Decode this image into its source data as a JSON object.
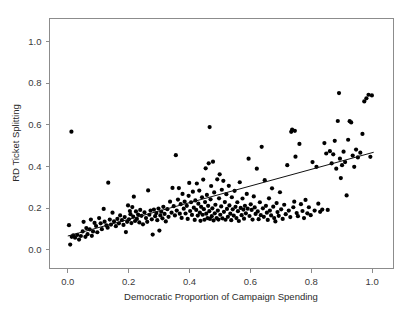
{
  "chart_data": {
    "type": "scatter",
    "title": "",
    "subtitle": "",
    "xlabel": "Democratic Proportion of Campaign Spending",
    "ylabel": "RD Ticket Splitting",
    "xlim": [
      -0.06,
      1.07
    ],
    "ylim": [
      -0.09,
      1.11
    ],
    "xticks": [
      0.0,
      0.2,
      0.4,
      0.6,
      0.8,
      1.0
    ],
    "xticklabels": [
      "0.0",
      "0.2",
      "0.4",
      "0.6",
      "0.8",
      "1.0"
    ],
    "yticks": [
      0.0,
      0.2,
      0.4,
      0.6,
      0.8,
      1.0
    ],
    "yticklabels": [
      "0.0",
      "0.2",
      "0.4",
      "0.6",
      "0.8",
      "1.0"
    ],
    "grid": false,
    "legend": null,
    "marker": "filled-circle",
    "marker_color": "#000000",
    "marker_size": 3.1,
    "frame_color": "#8c8c8c",
    "background": "#ffffff",
    "annotations": [],
    "fit_line": {
      "name": "least-squares fit",
      "color": "#111111",
      "x": [
        0.0,
        1.005
      ],
      "y": [
        0.066,
        0.468
      ],
      "slope": 0.4,
      "intercept": 0.066
    },
    "series": [
      {
        "name": "districts",
        "n_points": 253,
        "points": [
          [
            0.012,
            0.567
          ],
          [
            0.004,
            0.118
          ],
          [
            0.008,
            0.025
          ],
          [
            0.013,
            0.062
          ],
          [
            0.018,
            0.069
          ],
          [
            0.024,
            0.058
          ],
          [
            0.031,
            0.071
          ],
          [
            0.037,
            0.049
          ],
          [
            0.043,
            0.066
          ],
          [
            0.049,
            0.088
          ],
          [
            0.052,
            0.134
          ],
          [
            0.058,
            0.062
          ],
          [
            0.061,
            0.104
          ],
          [
            0.065,
            0.075
          ],
          [
            0.072,
            0.098
          ],
          [
            0.076,
            0.145
          ],
          [
            0.079,
            0.067
          ],
          [
            0.083,
            0.088
          ],
          [
            0.088,
            0.129
          ],
          [
            0.093,
            0.114
          ],
          [
            0.097,
            0.084
          ],
          [
            0.103,
            0.152
          ],
          [
            0.108,
            0.127
          ],
          [
            0.112,
            0.099
          ],
          [
            0.118,
            0.196
          ],
          [
            0.121,
            0.135
          ],
          [
            0.127,
            0.117
          ],
          [
            0.131,
            0.106
          ],
          [
            0.133,
            0.322
          ],
          [
            0.138,
            0.145
          ],
          [
            0.142,
            0.121
          ],
          [
            0.147,
            0.178
          ],
          [
            0.152,
            0.136
          ],
          [
            0.158,
            0.113
          ],
          [
            0.163,
            0.148
          ],
          [
            0.168,
            0.127
          ],
          [
            0.172,
            0.165
          ],
          [
            0.178,
            0.142
          ],
          [
            0.183,
            0.119
          ],
          [
            0.187,
            0.157
          ],
          [
            0.191,
            0.085
          ],
          [
            0.195,
            0.134
          ],
          [
            0.198,
            0.213
          ],
          [
            0.201,
            0.146
          ],
          [
            0.204,
            0.186
          ],
          [
            0.206,
            0.171
          ],
          [
            0.209,
            0.128
          ],
          [
            0.212,
            0.205
          ],
          [
            0.215,
            0.159
          ],
          [
            0.217,
            0.255
          ],
          [
            0.221,
            0.138
          ],
          [
            0.224,
            0.184
          ],
          [
            0.227,
            0.148
          ],
          [
            0.231,
            0.169
          ],
          [
            0.235,
            0.131
          ],
          [
            0.238,
            0.191
          ],
          [
            0.242,
            0.163
          ],
          [
            0.247,
            0.122
          ],
          [
            0.252,
            0.179
          ],
          [
            0.257,
            0.152
          ],
          [
            0.261,
            0.134
          ],
          [
            0.264,
            0.285
          ],
          [
            0.268,
            0.168
          ],
          [
            0.272,
            0.188
          ],
          [
            0.276,
            0.146
          ],
          [
            0.279,
            0.073
          ],
          [
            0.283,
            0.193
          ],
          [
            0.287,
            0.161
          ],
          [
            0.291,
            0.176
          ],
          [
            0.294,
            0.142
          ],
          [
            0.298,
            0.198
          ],
          [
            0.301,
            0.092
          ],
          [
            0.304,
            0.165
          ],
          [
            0.307,
            0.183
          ],
          [
            0.311,
            0.151
          ],
          [
            0.314,
            0.206
          ],
          [
            0.318,
            0.172
          ],
          [
            0.322,
            0.136
          ],
          [
            0.327,
            0.195
          ],
          [
            0.331,
            0.158
          ],
          [
            0.336,
            0.231
          ],
          [
            0.341,
            0.178
          ],
          [
            0.344,
            0.297
          ],
          [
            0.348,
            0.209
          ],
          [
            0.352,
            0.165
          ],
          [
            0.355,
            0.454
          ],
          [
            0.358,
            0.188
          ],
          [
            0.362,
            0.241
          ],
          [
            0.365,
            0.296
          ],
          [
            0.368,
            0.173
          ],
          [
            0.371,
            0.219
          ],
          [
            0.374,
            0.153
          ],
          [
            0.377,
            0.268
          ],
          [
            0.381,
            0.197
          ],
          [
            0.384,
            0.231
          ],
          [
            0.387,
            0.174
          ],
          [
            0.391,
            0.211
          ],
          [
            0.394,
            0.148
          ],
          [
            0.397,
            0.259
          ],
          [
            0.399,
            0.321
          ],
          [
            0.402,
            0.186
          ],
          [
            0.405,
            0.228
          ],
          [
            0.408,
            0.167
          ],
          [
            0.411,
            0.279
          ],
          [
            0.414,
            0.202
          ],
          [
            0.417,
            0.143
          ],
          [
            0.419,
            0.237
          ],
          [
            0.422,
            0.191
          ],
          [
            0.424,
            0.318
          ],
          [
            0.427,
            0.164
          ],
          [
            0.429,
            0.221
          ],
          [
            0.432,
            0.284
          ],
          [
            0.434,
            0.178
          ],
          [
            0.436,
            0.139
          ],
          [
            0.438,
            0.206
          ],
          [
            0.441,
            0.252
          ],
          [
            0.443,
            0.168
          ],
          [
            0.445,
            0.337
          ],
          [
            0.447,
            0.195
          ],
          [
            0.449,
            0.144
          ],
          [
            0.451,
            0.229
          ],
          [
            0.453,
            0.391
          ],
          [
            0.455,
            0.173
          ],
          [
            0.457,
            0.263
          ],
          [
            0.459,
            0.152
          ],
          [
            0.461,
            0.211
          ],
          [
            0.463,
            0.415
          ],
          [
            0.465,
            0.185
          ],
          [
            0.467,
            0.148
          ],
          [
            0.469,
            0.242
          ],
          [
            0.471,
            0.306
          ],
          [
            0.473,
            0.161
          ],
          [
            0.475,
            0.199
          ],
          [
            0.477,
            0.423
          ],
          [
            0.479,
            0.141
          ],
          [
            0.481,
            0.275
          ],
          [
            0.483,
            0.175
          ],
          [
            0.485,
            0.216
          ],
          [
            0.466,
            0.589
          ],
          [
            0.489,
            0.152
          ],
          [
            0.491,
            0.338
          ],
          [
            0.493,
            0.188
          ],
          [
            0.495,
            0.145
          ],
          [
            0.497,
            0.247
          ],
          [
            0.499,
            0.362
          ],
          [
            0.501,
            0.168
          ],
          [
            0.504,
            0.208
          ],
          [
            0.506,
            0.288
          ],
          [
            0.508,
            0.151
          ],
          [
            0.511,
            0.331
          ],
          [
            0.513,
            0.182
          ],
          [
            0.516,
            0.229
          ],
          [
            0.518,
            0.144
          ],
          [
            0.521,
            0.267
          ],
          [
            0.523,
            0.196
          ],
          [
            0.526,
            0.158
          ],
          [
            0.529,
            0.307
          ],
          [
            0.531,
            0.213
          ],
          [
            0.534,
            0.173
          ],
          [
            0.537,
            0.142
          ],
          [
            0.539,
            0.252
          ],
          [
            0.542,
            0.194
          ],
          [
            0.545,
            0.164
          ],
          [
            0.548,
            0.283
          ],
          [
            0.551,
            0.206
          ],
          [
            0.554,
            0.152
          ],
          [
            0.557,
            0.228
          ],
          [
            0.559,
            0.185
          ],
          [
            0.562,
            0.138
          ],
          [
            0.565,
            0.324
          ],
          [
            0.568,
            0.201
          ],
          [
            0.571,
            0.166
          ],
          [
            0.574,
            0.246
          ],
          [
            0.577,
            0.193
          ],
          [
            0.579,
            0.149
          ],
          [
            0.582,
            0.211
          ],
          [
            0.585,
            0.175
          ],
          [
            0.588,
            0.268
          ],
          [
            0.591,
            0.197
          ],
          [
            0.594,
            0.437
          ],
          [
            0.597,
            0.162
          ],
          [
            0.601,
            0.218
          ],
          [
            0.604,
            0.191
          ],
          [
            0.607,
            0.145
          ],
          [
            0.611,
            0.256
          ],
          [
            0.614,
            0.203
          ],
          [
            0.617,
            0.172
          ],
          [
            0.621,
            0.389
          ],
          [
            0.624,
            0.184
          ],
          [
            0.627,
            0.147
          ],
          [
            0.631,
            0.228
          ],
          [
            0.634,
            0.166
          ],
          [
            0.637,
            0.494
          ],
          [
            0.641,
            0.199
          ],
          [
            0.644,
            0.158
          ],
          [
            0.647,
            0.334
          ],
          [
            0.651,
            0.211
          ],
          [
            0.654,
            0.178
          ],
          [
            0.657,
            0.143
          ],
          [
            0.661,
            0.247
          ],
          [
            0.664,
            0.188
          ],
          [
            0.668,
            0.165
          ],
          [
            0.671,
            0.295
          ],
          [
            0.675,
            0.207
          ],
          [
            0.678,
            0.152
          ],
          [
            0.682,
            0.136
          ],
          [
            0.686,
            0.224
          ],
          [
            0.689,
            0.181
          ],
          [
            0.693,
            0.163
          ],
          [
            0.697,
            0.276
          ],
          [
            0.701,
            0.194
          ],
          [
            0.706,
            0.148
          ],
          [
            0.711,
            0.216
          ],
          [
            0.716,
            0.171
          ],
          [
            0.721,
            0.406
          ],
          [
            0.726,
            0.188
          ],
          [
            0.731,
            0.157
          ],
          [
            0.734,
            0.566
          ],
          [
            0.737,
            0.577
          ],
          [
            0.741,
            0.204
          ],
          [
            0.744,
            0.231
          ],
          [
            0.746,
            0.571
          ],
          [
            0.748,
            0.447
          ],
          [
            0.752,
            0.176
          ],
          [
            0.756,
            0.161
          ],
          [
            0.761,
            0.508
          ],
          [
            0.766,
            0.219
          ],
          [
            0.771,
            0.186
          ],
          [
            0.776,
            0.152
          ],
          [
            0.781,
            0.239
          ],
          [
            0.787,
            0.175
          ],
          [
            0.792,
            0.204
          ],
          [
            0.798,
            0.166
          ],
          [
            0.804,
            0.421
          ],
          [
            0.811,
            0.188
          ],
          [
            0.817,
            0.398
          ],
          [
            0.823,
            0.221
          ],
          [
            0.829,
            0.182
          ],
          [
            0.836,
            0.193
          ],
          [
            0.843,
            0.512
          ],
          [
            0.849,
            0.462
          ],
          [
            0.854,
            0.191
          ],
          [
            0.861,
            0.473
          ],
          [
            0.867,
            0.415
          ],
          [
            0.872,
            0.458
          ],
          [
            0.877,
            0.523
          ],
          [
            0.882,
            0.389
          ],
          [
            0.887,
            0.618
          ],
          [
            0.891,
            0.752
          ],
          [
            0.894,
            0.437
          ],
          [
            0.897,
            0.344
          ],
          [
            0.901,
            0.406
          ],
          [
            0.906,
            0.471
          ],
          [
            0.911,
            0.421
          ],
          [
            0.916,
            0.261
          ],
          [
            0.921,
            0.528
          ],
          [
            0.926,
            0.617
          ],
          [
            0.931,
            0.611
          ],
          [
            0.936,
            0.452
          ],
          [
            0.941,
            0.398
          ],
          [
            0.947,
            0.481
          ],
          [
            0.953,
            0.443
          ],
          [
            0.961,
            0.466
          ],
          [
            0.968,
            0.556
          ],
          [
            0.974,
            0.712
          ],
          [
            0.981,
            0.727
          ],
          [
            0.988,
            0.744
          ],
          [
            0.994,
            0.446
          ],
          [
            0.999,
            0.741
          ]
        ]
      }
    ]
  },
  "axes": {
    "x_title": "Democratic Proportion of Campaign Spending",
    "y_title": "RD Ticket Splitting",
    "x_tick_labels": [
      "0.0",
      "0.2",
      "0.4",
      "0.6",
      "0.8",
      "1.0"
    ],
    "y_tick_labels": [
      "0.0",
      "0.2",
      "0.4",
      "0.6",
      "0.8",
      "1.0"
    ]
  }
}
